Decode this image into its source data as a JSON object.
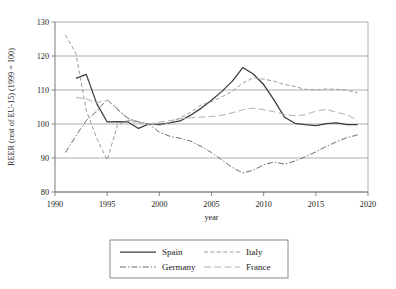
{
  "chart_data": {
    "type": "line",
    "title": "",
    "xlabel": "year",
    "ylabel": "REER (rest of EU-15) (1999 = 100)",
    "xlim": [
      1990,
      2020
    ],
    "ylim": [
      80,
      130
    ],
    "xticks": [
      1990,
      1995,
      2000,
      2005,
      2010,
      2015,
      2020
    ],
    "yticks": [
      80,
      90,
      100,
      110,
      120,
      130
    ],
    "xtick_labels": [
      "1990",
      "1995",
      "2000",
      "2005",
      "2010",
      "2015",
      "2020"
    ],
    "ytick_labels": [
      "80",
      "90",
      "100",
      "110",
      "120",
      "130"
    ],
    "grid": "horizontal",
    "legend_position": "bottom-center",
    "series": [
      {
        "name": "Spain",
        "style": "solid",
        "color": "#3a3a3a",
        "x": [
          1992,
          1993,
          1994,
          1995,
          1996,
          1997,
          1998,
          1999,
          2000,
          2001,
          2002,
          2003,
          2004,
          2005,
          2006,
          2007,
          2008,
          2009,
          2010,
          2011,
          2012,
          2013,
          2014,
          2015,
          2016,
          2017,
          2018,
          2019
        ],
        "values": [
          113.4,
          114.6,
          106.0,
          100.6,
          100.7,
          100.6,
          98.7,
          100.0,
          99.9,
          100.3,
          100.9,
          102.6,
          104.6,
          107.0,
          109.6,
          112.6,
          116.6,
          114.7,
          111.6,
          107.0,
          102.0,
          100.2,
          99.8,
          99.5,
          100.1,
          100.3,
          99.8,
          99.8
        ]
      },
      {
        "name": "Germany",
        "style": "dashdot",
        "color": "#6e6e6e",
        "x": [
          1991,
          1992,
          1993,
          1994,
          1995,
          1996,
          1997,
          1998,
          1999,
          2000,
          2001,
          2002,
          2003,
          2004,
          2005,
          2006,
          2007,
          2008,
          2009,
          2010,
          2011,
          2012,
          2013,
          2014,
          2015,
          2016,
          2017,
          2018,
          2019
        ],
        "values": [
          91.6,
          96.5,
          101.0,
          103.8,
          107.2,
          104.2,
          101.7,
          100.6,
          100.0,
          97.6,
          96.4,
          95.8,
          95.0,
          93.4,
          91.6,
          89.4,
          87.2,
          85.6,
          86.4,
          88.0,
          88.8,
          88.2,
          89.1,
          90.4,
          91.8,
          93.4,
          94.8,
          96.0,
          96.8
        ]
      },
      {
        "name": "Italy",
        "style": "dashed",
        "color": "#9a9a9a",
        "x": [
          1991,
          1992,
          1993,
          1994,
          1995,
          1996,
          1997,
          1998,
          1999,
          2000,
          2001,
          2002,
          2003,
          2004,
          2005,
          2006,
          2007,
          2008,
          2009,
          2010,
          2011,
          2012,
          2013,
          2014,
          2015,
          2016,
          2017,
          2018,
          2019
        ],
        "values": [
          126.2,
          120.8,
          104.0,
          95.8,
          89.4,
          99.8,
          101.0,
          100.4,
          100.0,
          99.6,
          100.4,
          101.8,
          103.4,
          105.6,
          106.6,
          108.0,
          109.6,
          112.0,
          113.6,
          113.2,
          112.6,
          111.6,
          111.0,
          110.2,
          110.0,
          110.3,
          110.2,
          109.9,
          109.2
        ]
      },
      {
        "name": "France",
        "style": "longdash",
        "color": "#b0b0b0",
        "x": [
          1992,
          1993,
          1994,
          1995,
          1996,
          1997,
          1998,
          1999,
          2000,
          2001,
          2002,
          2003,
          2004,
          2005,
          2006,
          2007,
          2008,
          2009,
          2010,
          2011,
          2012,
          2013,
          2014,
          2015,
          2016,
          2017,
          2018,
          2019
        ],
        "values": [
          107.8,
          107.4,
          106.2,
          107.0,
          104.6,
          101.2,
          100.6,
          100.0,
          100.5,
          101.0,
          101.5,
          101.8,
          102.0,
          102.2,
          102.6,
          103.3,
          104.2,
          104.7,
          104.2,
          103.6,
          102.8,
          102.4,
          102.7,
          103.8,
          104.3,
          103.4,
          102.7,
          101.1
        ]
      }
    ]
  },
  "legend": {
    "items": [
      {
        "label": "Spain"
      },
      {
        "label": "Italy"
      },
      {
        "label": "Germany"
      },
      {
        "label": "France"
      }
    ]
  }
}
